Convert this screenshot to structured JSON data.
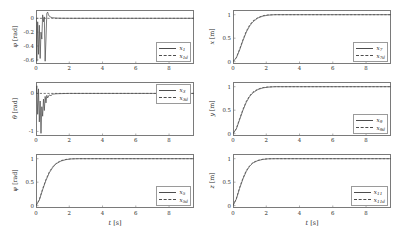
{
  "figure": {
    "background": "#ffffff",
    "line_color": "#4d4d4d",
    "axis_color": "#7a7a7a",
    "xlabel": "t [s]",
    "xticks": [
      "0",
      "2",
      "4",
      "6",
      "8"
    ],
    "xlim": [
      0,
      9.5
    ]
  },
  "chart_data": [
    {
      "type": "line",
      "id": "phi",
      "title": "",
      "xlabel": "t [s]",
      "ylabel": "φ [rad]",
      "ylabel_symbol": "φ",
      "ylabel_unit": "rad",
      "xlim": [
        0,
        9.5
      ],
      "ylim": [
        -0.66,
        0.12
      ],
      "yticks": [
        "0",
        "-0.2",
        "-0.4",
        "-0.6"
      ],
      "ytick_values": [
        0,
        -0.2,
        -0.4,
        -0.6
      ],
      "grid": false,
      "legend_position": "lower right",
      "series": [
        {
          "name": "x_1",
          "label_base": "x",
          "label_sub": "1",
          "style": "solid",
          "x": [
            0,
            0.05,
            0.1,
            0.15,
            0.2,
            0.25,
            0.3,
            0.35,
            0.4,
            0.45,
            0.5,
            0.55,
            0.6,
            0.65,
            0.7,
            0.75,
            0.8,
            0.9,
            1.0,
            1.2,
            1.5,
            2.0,
            3.0,
            5.0,
            7.0,
            9.5
          ],
          "y": [
            0,
            -0.62,
            -0.05,
            -0.52,
            -0.1,
            -0.58,
            -0.2,
            -0.3,
            0.05,
            -0.05,
            0.02,
            -0.62,
            -0.3,
            0.07,
            0.09,
            0.05,
            0.03,
            0.015,
            0.008,
            0.003,
            0.001,
            0,
            0,
            0,
            0,
            0
          ]
        },
        {
          "name": "x_1d",
          "label_base": "x",
          "label_sub": "1d",
          "style": "dashed",
          "x": [
            0,
            9.5
          ],
          "y": [
            0,
            0
          ]
        }
      ]
    },
    {
      "type": "line",
      "id": "x-pos",
      "title": "",
      "xlabel": "t [s]",
      "ylabel": "x [m]",
      "ylabel_symbol": "x",
      "ylabel_unit": "m",
      "xlim": [
        0,
        9.5
      ],
      "ylim": [
        -0.05,
        1.1
      ],
      "yticks": [
        "1",
        "0.5",
        "0"
      ],
      "ytick_values": [
        1,
        0.5,
        0
      ],
      "grid": false,
      "legend_position": "lower right",
      "series": [
        {
          "name": "x_7",
          "label_base": "x",
          "label_sub": "7",
          "style": "solid",
          "x": [
            0,
            0.2,
            0.4,
            0.6,
            0.8,
            1.0,
            1.2,
            1.5,
            1.8,
            2.1,
            2.5,
            3.0,
            4.0,
            6.0,
            9.5
          ],
          "y": [
            0,
            0.08,
            0.25,
            0.45,
            0.63,
            0.76,
            0.85,
            0.93,
            0.97,
            0.99,
            1.0,
            1.0,
            1.0,
            1.0,
            1.0
          ]
        },
        {
          "name": "x_7d",
          "label_base": "x",
          "label_sub": "7d",
          "style": "dashed",
          "x": [
            0,
            0.2,
            0.4,
            0.6,
            0.8,
            1.0,
            1.2,
            1.5,
            1.8,
            2.1,
            2.5,
            3.0,
            4.0,
            6.0,
            9.5
          ],
          "y": [
            0,
            0.09,
            0.27,
            0.47,
            0.65,
            0.78,
            0.87,
            0.94,
            0.98,
            0.995,
            1.0,
            1.0,
            1.0,
            1.0,
            1.0
          ]
        }
      ]
    },
    {
      "type": "line",
      "id": "theta",
      "title": "",
      "xlabel": "t [s]",
      "ylabel": "θ [rad]",
      "ylabel_symbol": "θ",
      "ylabel_unit": "rad",
      "xlim": [
        0,
        9.5
      ],
      "ylim": [
        -1.12,
        0.3
      ],
      "yticks": [
        "0",
        "-1"
      ],
      "ytick_values": [
        0,
        -1
      ],
      "grid": false,
      "legend_position": "upper right",
      "series": [
        {
          "name": "x_3",
          "label_base": "x",
          "label_sub": "3",
          "style": "solid",
          "x": [
            0,
            0.05,
            0.1,
            0.15,
            0.2,
            0.25,
            0.3,
            0.35,
            0.4,
            0.45,
            0.5,
            0.55,
            0.6,
            0.65,
            0.7,
            0.8,
            0.9,
            1.0,
            1.2,
            1.5,
            2.0,
            3.0,
            5.0,
            7.0,
            9.5
          ],
          "y": [
            0,
            0.2,
            -0.55,
            0.12,
            -0.75,
            -0.2,
            -1.05,
            -0.35,
            -0.6,
            -0.15,
            -0.45,
            -0.08,
            -0.25,
            -0.05,
            -0.12,
            -0.04,
            -0.06,
            -0.02,
            -0.01,
            -0.005,
            0,
            0,
            0,
            0,
            0
          ]
        },
        {
          "name": "x_3d",
          "label_base": "x",
          "label_sub": "3d",
          "style": "dashed",
          "x": [
            0,
            9.5
          ],
          "y": [
            0,
            0
          ]
        }
      ]
    },
    {
      "type": "line",
      "id": "y-pos",
      "title": "",
      "xlabel": "t [s]",
      "ylabel": "y [m]",
      "ylabel_symbol": "y",
      "ylabel_unit": "m",
      "xlim": [
        0,
        9.5
      ],
      "ylim": [
        -0.05,
        1.1
      ],
      "yticks": [
        "1",
        "0.5",
        "0"
      ],
      "ytick_values": [
        1,
        0.5,
        0
      ],
      "grid": false,
      "legend_position": "lower right",
      "series": [
        {
          "name": "x_9",
          "label_base": "x",
          "label_sub": "9",
          "style": "solid",
          "x": [
            0,
            0.2,
            0.4,
            0.6,
            0.8,
            1.0,
            1.2,
            1.5,
            1.8,
            2.1,
            2.5,
            3.0,
            4.0,
            6.0,
            9.5
          ],
          "y": [
            0,
            0.1,
            0.3,
            0.5,
            0.67,
            0.79,
            0.87,
            0.94,
            0.975,
            0.99,
            1.0,
            1.0,
            1.0,
            1.0,
            1.0
          ]
        },
        {
          "name": "x_9d",
          "label_base": "x",
          "label_sub": "9d",
          "style": "dashed",
          "x": [
            0,
            0.2,
            0.4,
            0.6,
            0.8,
            1.0,
            1.2,
            1.5,
            1.8,
            2.1,
            2.5,
            3.0,
            4.0,
            6.0,
            9.5
          ],
          "y": [
            0,
            0.11,
            0.32,
            0.52,
            0.69,
            0.81,
            0.89,
            0.95,
            0.98,
            0.995,
            1.0,
            1.0,
            1.0,
            1.0,
            1.0
          ]
        }
      ]
    },
    {
      "type": "line",
      "id": "psi",
      "title": "",
      "xlabel": "t [s]",
      "ylabel": "ψ [rad]",
      "ylabel_symbol": "ψ",
      "ylabel_unit": "rad",
      "xlim": [
        0,
        9.5
      ],
      "ylim": [
        -0.05,
        1.1
      ],
      "yticks": [
        "1",
        "0.5",
        "0"
      ],
      "ytick_values": [
        1,
        0.5,
        0
      ],
      "grid": false,
      "legend_position": "lower right",
      "series": [
        {
          "name": "x_5",
          "label_base": "x",
          "label_sub": "5",
          "style": "solid",
          "x": [
            0,
            0.2,
            0.4,
            0.6,
            0.8,
            1.0,
            1.2,
            1.5,
            1.8,
            2.1,
            2.5,
            3.0,
            4.0,
            6.0,
            9.5
          ],
          "y": [
            0,
            0.12,
            0.34,
            0.54,
            0.7,
            0.81,
            0.89,
            0.95,
            0.98,
            0.995,
            1.0,
            1.0,
            1.0,
            1.0,
            1.0
          ]
        },
        {
          "name": "x_5d",
          "label_base": "x",
          "label_sub": "5d",
          "style": "dashed",
          "x": [
            0,
            0.2,
            0.4,
            0.6,
            0.8,
            1.0,
            1.2,
            1.5,
            1.8,
            2.1,
            2.5,
            3.0,
            4.0,
            6.0,
            9.5
          ],
          "y": [
            0,
            0.13,
            0.36,
            0.56,
            0.72,
            0.83,
            0.9,
            0.96,
            0.985,
            0.997,
            1.0,
            1.0,
            1.0,
            1.0,
            1.0
          ]
        }
      ]
    },
    {
      "type": "line",
      "id": "z-pos",
      "title": "",
      "xlabel": "t [s]",
      "ylabel": "z [m]",
      "ylabel_symbol": "z",
      "ylabel_unit": "m",
      "xlim": [
        0,
        9.5
      ],
      "ylim": [
        -0.05,
        1.1
      ],
      "yticks": [
        "1",
        "0.5",
        "0"
      ],
      "ytick_values": [
        1,
        0.5,
        0
      ],
      "grid": false,
      "legend_position": "lower right",
      "series": [
        {
          "name": "x_11",
          "label_base": "x",
          "label_sub": "11",
          "style": "solid",
          "x": [
            0,
            0.2,
            0.4,
            0.6,
            0.8,
            1.0,
            1.2,
            1.5,
            1.8,
            2.1,
            2.5,
            3.0,
            4.0,
            6.0,
            9.5
          ],
          "y": [
            0,
            0.14,
            0.37,
            0.57,
            0.73,
            0.84,
            0.91,
            0.96,
            0.985,
            0.997,
            1.0,
            1.0,
            1.0,
            1.0,
            1.0
          ]
        },
        {
          "name": "x_11d",
          "label_base": "x",
          "label_sub": "11d",
          "style": "dashed",
          "x": [
            0,
            0.2,
            0.4,
            0.6,
            0.8,
            1.0,
            1.2,
            1.5,
            1.8,
            2.1,
            2.5,
            3.0,
            4.0,
            6.0,
            9.5
          ],
          "y": [
            0,
            0.15,
            0.39,
            0.59,
            0.75,
            0.85,
            0.92,
            0.965,
            0.99,
            0.998,
            1.0,
            1.0,
            1.0,
            1.0,
            1.0
          ]
        }
      ]
    }
  ]
}
